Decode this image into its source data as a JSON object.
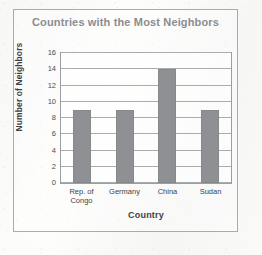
{
  "chart_data": {
    "type": "bar",
    "title": "Countries with the Most Neighbors",
    "xlabel": "Country",
    "ylabel": "Number of Neighbors",
    "categories": [
      "Rep. of Congo",
      "Germany",
      "China",
      "Sudan"
    ],
    "category_lines": [
      [
        "Rep. of",
        "Congo"
      ],
      [
        "Germany"
      ],
      [
        "China"
      ],
      [
        "Sudan"
      ]
    ],
    "values": [
      9,
      9,
      14,
      9
    ],
    "ylim": [
      0,
      16
    ],
    "ytick_step": 2,
    "yticks": [
      0,
      2,
      4,
      6,
      8,
      10,
      12,
      14,
      16
    ],
    "ytick_labels": [
      "0",
      "2",
      "4",
      "6",
      "8",
      "10",
      "12",
      "14",
      "16"
    ],
    "grid": true,
    "legend": false,
    "bar_color": "#8f9093",
    "title_color": "#8a8d92",
    "axis_text_color": "#3f4144"
  }
}
